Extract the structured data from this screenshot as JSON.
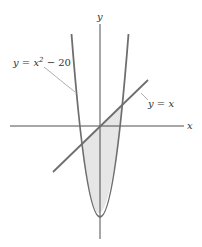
{
  "figure": {
    "axes": {
      "x_label": "x",
      "y_label": "y"
    },
    "curves": [
      {
        "name": "parabola",
        "label": "y = x² − 20",
        "label_prefix": "y = x",
        "label_exp": "2",
        "label_suffix": " − 20"
      },
      {
        "name": "line",
        "label": "y = x"
      }
    ],
    "shaded_region": "region between y = x and y = x² − 20",
    "colors": {
      "curve": "#6e6e6e",
      "axis": "#3a3a3a",
      "shade": "#e6e6e6",
      "leader": "#9a9a9a"
    }
  }
}
